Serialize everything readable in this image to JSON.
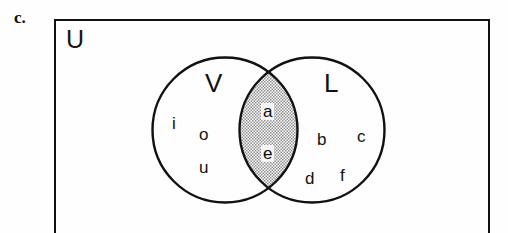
{
  "problem": {
    "label": "c."
  },
  "diagram": {
    "type": "venn",
    "universe": {
      "label": "U",
      "name": "universal-set"
    },
    "sets": [
      {
        "id": "V",
        "label": "V",
        "name": "set-v-vowels",
        "members_only": [
          "i",
          "o",
          "u"
        ]
      },
      {
        "id": "L",
        "label": "L",
        "name": "set-l",
        "members_only": [
          "b",
          "c",
          "d",
          "f"
        ]
      }
    ],
    "intersection": {
      "label": "V and L",
      "members": [
        "a",
        "e"
      ],
      "shaded": true,
      "fill_pattern": "stipple-dots",
      "fill_color": "#b8b8b8"
    },
    "outline_color": "#111111",
    "background_color": "#ffffff"
  },
  "members": {
    "v_only": [
      {
        "text": "i",
        "x": 172,
        "y": 115
      },
      {
        "text": "o",
        "x": 199,
        "y": 126
      },
      {
        "text": "u",
        "x": 199,
        "y": 159
      }
    ],
    "overlap": [
      {
        "text": "a",
        "x": 261,
        "y": 103
      },
      {
        "text": "e",
        "x": 261,
        "y": 145
      }
    ],
    "l_only": [
      {
        "text": "b",
        "x": 317,
        "y": 131
      },
      {
        "text": "c",
        "x": 357,
        "y": 128
      },
      {
        "text": "d",
        "x": 305,
        "y": 170
      },
      {
        "text": "f",
        "x": 340,
        "y": 167
      }
    ]
  }
}
